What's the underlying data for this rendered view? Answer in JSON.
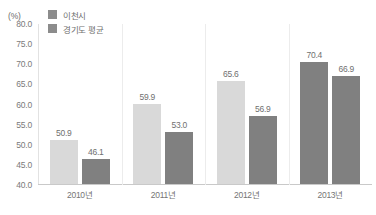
{
  "chart_data": {
    "type": "bar",
    "title": "",
    "subtitle": "",
    "unit_label": "(%)",
    "xlabel": "",
    "ylabel": "",
    "categories": [
      "2010년",
      "2011년",
      "2012년",
      "2013년"
    ],
    "series": [
      {
        "name": "이천시",
        "color": "#d9d9d9",
        "values": [
          50.9,
          59.9,
          65.6,
          70.4
        ],
        "value_labels": [
          "50.9",
          "59.9",
          "65.6",
          "70.4"
        ],
        "bar_colors": [
          "#d9d9d9",
          "#d9d9d9",
          "#d9d9d9",
          "#808080"
        ]
      },
      {
        "name": "경기도 평균",
        "color": "#808080",
        "values": [
          46.1,
          53.0,
          56.9,
          66.9
        ],
        "value_labels": [
          "46.1",
          "53.0",
          "56.9",
          "66.9"
        ],
        "bar_colors": [
          "#808080",
          "#808080",
          "#808080",
          "#808080"
        ]
      }
    ],
    "ylim": [
      40.0,
      80.0
    ],
    "ytick_step": 5.0,
    "yticks": [
      "80.0",
      "75.0",
      "70.0",
      "65.0",
      "60.0",
      "55.0",
      "50.0",
      "45.0",
      "40.0"
    ],
    "ytick_values": [
      80.0,
      75.0,
      70.0,
      65.0,
      60.0,
      55.0,
      50.0,
      45.0,
      40.0
    ],
    "grid": false,
    "legend_position": "top-left",
    "legend_swatch_color": "#8c8c8c"
  }
}
